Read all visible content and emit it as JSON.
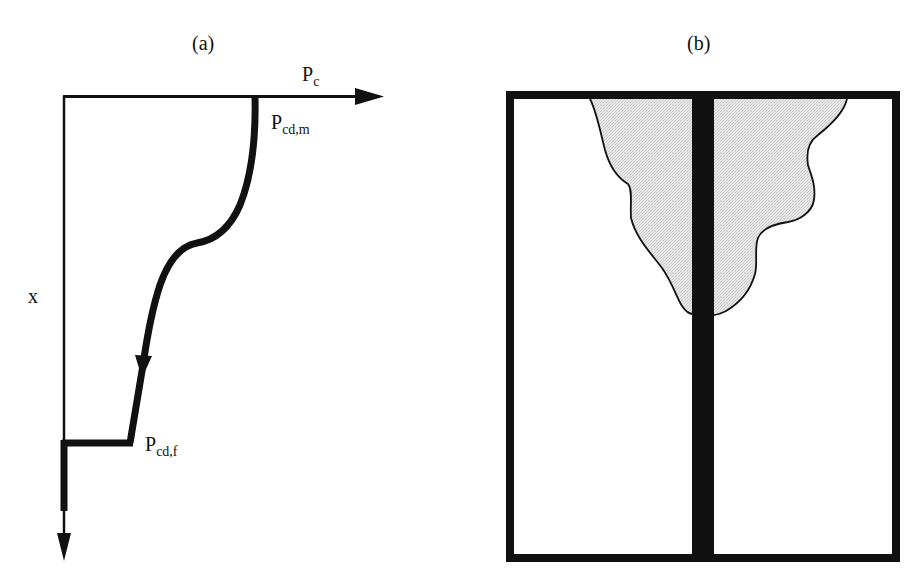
{
  "figure": {
    "panel_a": {
      "title": "(a)",
      "axis_horizontal_label": {
        "main": "P",
        "sub": "c"
      },
      "axis_vertical_label": "x",
      "point_top_label": {
        "main": "P",
        "sub": "cd,m"
      },
      "point_bottom_label": {
        "main": "P",
        "sub": "cd,f"
      }
    },
    "panel_b": {
      "title": "(b)"
    },
    "colors": {
      "ink": "#111111",
      "shaded_region": "#e0e0e0",
      "background": "#ffffff"
    }
  }
}
